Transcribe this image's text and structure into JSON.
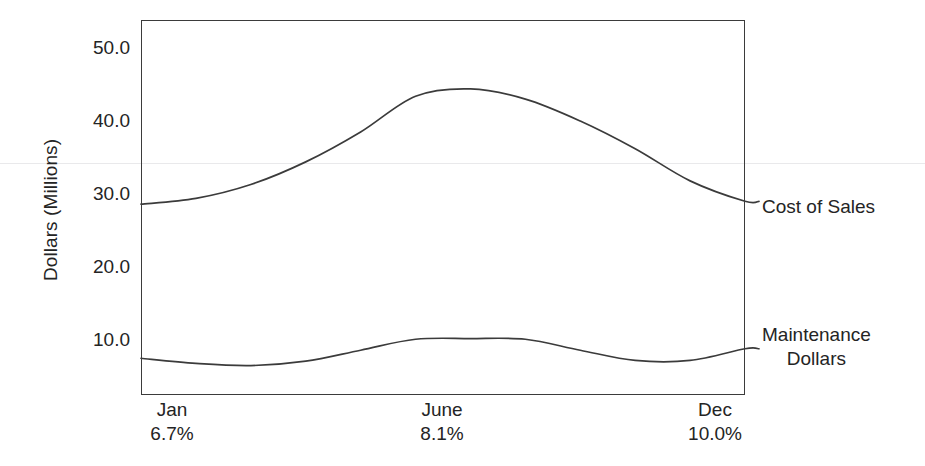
{
  "chart_data": {
    "type": "line",
    "title": "",
    "subtitle": "",
    "xlabel": "",
    "ylabel": "Dollars (Millions)",
    "ylim": [
      0,
      54
    ],
    "yticks": [
      10.0,
      20.0,
      30.0,
      40.0,
      50.0
    ],
    "ytick_labels": [
      "10.0",
      "20.0",
      "30.0",
      "40.0",
      "50.0"
    ],
    "xticks": [
      "Jan",
      "June",
      "Dec"
    ],
    "xtick_sublabels": [
      "6.7%",
      "8.1%",
      "10.0%"
    ],
    "grid": false,
    "legend_position": "right-inline",
    "frame": "box",
    "series": [
      {
        "name": "Cost of Sales",
        "label_position": "right",
        "x": [
          "Jan",
          "Feb",
          "Mar",
          "Apr",
          "May",
          "June",
          "July",
          "Aug",
          "Sep",
          "Oct",
          "Nov",
          "Dec"
        ],
        "values": [
          28.6,
          29.4,
          31.3,
          34.4,
          38.5,
          43.4,
          44.4,
          43.0,
          40.0,
          36.2,
          31.8,
          29.0
        ]
      },
      {
        "name": "Maintenance Dollars",
        "label_position": "right",
        "x": [
          "Jan",
          "Feb",
          "Mar",
          "Apr",
          "May",
          "June",
          "July",
          "Aug",
          "Sep",
          "Oct",
          "Nov",
          "Dec"
        ],
        "values": [
          7.5,
          6.8,
          6.5,
          7.1,
          8.6,
          10.1,
          10.2,
          10.1,
          8.6,
          7.2,
          7.2,
          8.8
        ]
      }
    ]
  },
  "axis": {
    "y_title": "Dollars (Millions)",
    "y_ticks": [
      {
        "label": "50.0",
        "value": 50.0
      },
      {
        "label": "40.0",
        "value": 40.0
      },
      {
        "label": "30.0",
        "value": 30.0
      },
      {
        "label": "20.0",
        "value": 20.0
      },
      {
        "label": "10.0",
        "value": 10.0
      }
    ],
    "x_ticks": [
      {
        "month": "Jan",
        "percent": "6.7%"
      },
      {
        "month": "June",
        "percent": "8.1%"
      },
      {
        "month": "Dec",
        "percent": "10.0%"
      }
    ]
  },
  "series_labels": {
    "cost_of_sales": "Cost of Sales",
    "maintenance_line1": "Maintenance",
    "maintenance_line2": "Dollars"
  },
  "colors": {
    "line": "#3b3b3b",
    "frame": "#3b3b3b",
    "text": "#242424",
    "background": "#ffffff"
  }
}
